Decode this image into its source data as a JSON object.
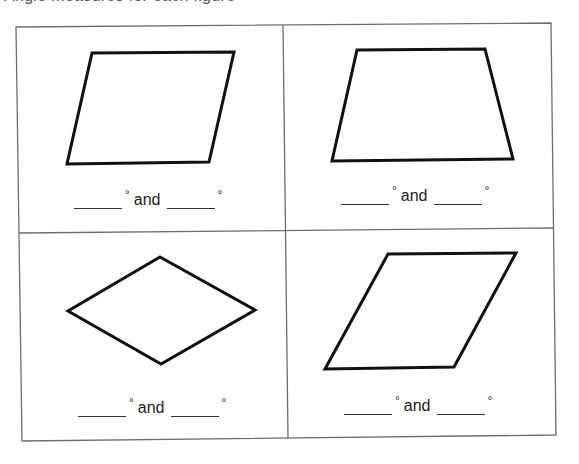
{
  "header": {
    "partial_text": "Angle measures for each figure"
  },
  "worksheet": {
    "grid": {
      "rows": 2,
      "columns": 2,
      "border_color": "#6e6e6e"
    },
    "cells": [
      {
        "position": "top-left",
        "shape": "parallelogram",
        "points": "92,53 234,52 209,162 67,164",
        "label": {
          "blank1": "",
          "degree_symbol": "°",
          "connector": "and",
          "blank2": "",
          "degree_symbol_2": "°"
        }
      },
      {
        "position": "top-right",
        "shape": "trapezoid",
        "points": "357,50 485,49 513,159 332,161",
        "label": {
          "blank1": "",
          "degree_symbol": "°",
          "connector": "and",
          "blank2": "",
          "degree_symbol_2": "°"
        }
      },
      {
        "position": "bottom-left",
        "shape": "rhombus",
        "points": "160,257 255,310 161,364 68,311",
        "label": {
          "blank1": "",
          "degree_symbol": "°",
          "connector": "and",
          "blank2": "",
          "degree_symbol_2": "°"
        }
      },
      {
        "position": "bottom-right",
        "shape": "parallelogram",
        "points": "388,254 516,253 454,367 325,369",
        "label": {
          "blank1": "",
          "degree_symbol": "°",
          "connector": "and",
          "blank2": "",
          "degree_symbol_2": "°"
        }
      }
    ]
  },
  "colors": {
    "shape_stroke": "#111111",
    "text": "#222222",
    "background": "#ffffff"
  }
}
